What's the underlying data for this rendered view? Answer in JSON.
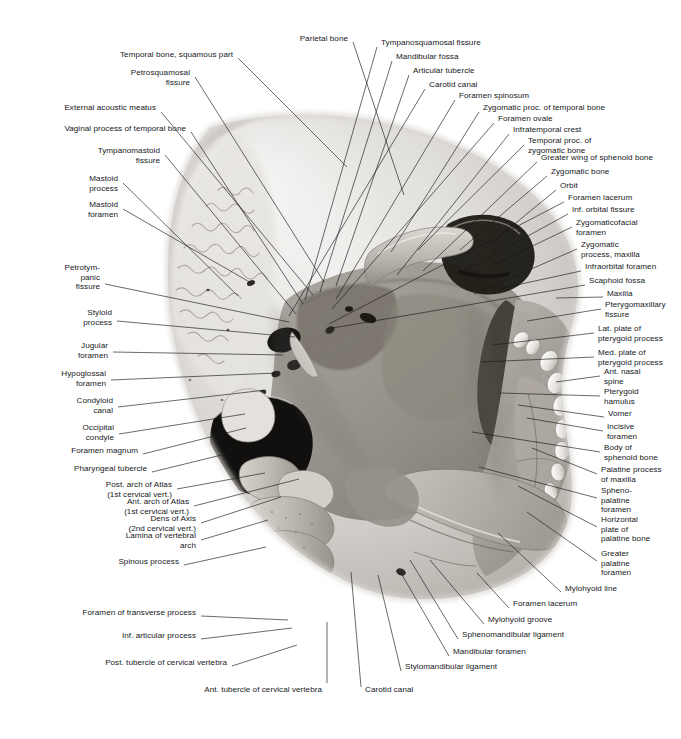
{
  "plate": {
    "kind": "anatomical-illustration",
    "subject": "Inferior view of skull base with cervical vertebrae",
    "render": "grayscale photograph with leader-line callouts",
    "width": 681,
    "height": 739,
    "background": "#ffffff",
    "leader_color": "#1a1a1a",
    "text_color": "#16181a"
  },
  "labels": [
    {
      "id": "temporal-bone-squamous-part",
      "text": "Temporal bone, squamous part",
      "align": "r",
      "x": 233,
      "y": 55,
      "lx": 238,
      "ly": 58,
      "tx": 347,
      "ty": 167
    },
    {
      "id": "parietal-bone",
      "text": "Parietal bone",
      "align": "r",
      "x": 348,
      "y": 39,
      "lx": 353,
      "ly": 42,
      "tx": 404,
      "ty": 195
    },
    {
      "id": "tympanosquamosal-fissure",
      "text": "Tympanosquamosal fissure",
      "align": "l",
      "x": 381,
      "y": 43,
      "lx": 377,
      "ly": 47,
      "tx": 305,
      "ty": 300
    },
    {
      "id": "petrosquamosal-fissure",
      "text": "Petrosquamosal\nfissure",
      "align": "r",
      "x": 190,
      "y": 73,
      "lx": 195,
      "ly": 77,
      "tx": 324,
      "ty": 282
    },
    {
      "id": "mandibular-fossa",
      "text": "Mandibular fossa",
      "align": "l",
      "x": 396,
      "y": 57,
      "lx": 392,
      "ly": 61,
      "tx": 320,
      "ty": 292
    },
    {
      "id": "articular-tubercle",
      "text": "Articular tubercle",
      "align": "l",
      "x": 413,
      "y": 71,
      "lx": 409,
      "ly": 75,
      "tx": 336,
      "ty": 286
    },
    {
      "id": "carotid-canal-top",
      "text": "Carotid canal",
      "align": "l",
      "x": 429,
      "y": 85,
      "lx": 425,
      "ly": 89,
      "tx": 289,
      "ty": 316
    },
    {
      "id": "external-acoustic-meatus",
      "text": "External acoustic meatus",
      "align": "r",
      "x": 156,
      "y": 108,
      "lx": 161,
      "ly": 112,
      "tx": 313,
      "ty": 295
    },
    {
      "id": "foramen-spinosum",
      "text": "Foramen spinosum",
      "align": "l",
      "x": 459,
      "y": 96,
      "lx": 455,
      "ly": 100,
      "tx": 336,
      "ty": 299
    },
    {
      "id": "zygomatic-proc-of-temporal-bone",
      "text": "Zygomatic proc. of temporal bone",
      "align": "l",
      "x": 483,
      "y": 108,
      "lx": 479,
      "ly": 112,
      "tx": 391,
      "ty": 252
    },
    {
      "id": "vaginal-process-of-temporal-bone",
      "text": "Vaginal process of temporal bone",
      "align": "r",
      "x": 186,
      "y": 129,
      "lx": 191,
      "ly": 132,
      "tx": 303,
      "ty": 304
    },
    {
      "id": "foramen-ovale",
      "text": "Foramen ovale",
      "align": "l",
      "x": 498,
      "y": 119,
      "lx": 494,
      "ly": 123,
      "tx": 332,
      "ty": 309
    },
    {
      "id": "infratemporal-crest",
      "text": "Infratemporal crest",
      "align": "l",
      "x": 513,
      "y": 130,
      "lx": 509,
      "ly": 134,
      "tx": 397,
      "ty": 275
    },
    {
      "id": "temporal-proc-of-zygomatic-bone",
      "text": "Temporal proc. of\nzygomatic bone",
      "align": "l",
      "x": 528,
      "y": 141,
      "lx": 524,
      "ly": 145,
      "tx": 418,
      "ty": 250
    },
    {
      "id": "tympanomastoid-fissure",
      "text": "Tympanomastoid\nfissure",
      "align": "r",
      "x": 160,
      "y": 151,
      "lx": 165,
      "ly": 155,
      "tx": 296,
      "ty": 314
    },
    {
      "id": "greater-wing-of-sphenoid-bone",
      "text": "Greater wing of sphenoid bone",
      "align": "l",
      "x": 541,
      "y": 158,
      "lx": 537,
      "ly": 162,
      "tx": 423,
      "ty": 271
    },
    {
      "id": "zygomatic-bone",
      "text": "Zygomatic bone",
      "align": "l",
      "x": 551,
      "y": 172,
      "lx": 547,
      "ly": 176,
      "tx": 460,
      "ty": 250
    },
    {
      "id": "orbit",
      "text": "Orbit",
      "align": "l",
      "x": 560,
      "y": 186,
      "lx": 556,
      "ly": 190,
      "tx": 478,
      "ty": 254
    },
    {
      "id": "mastoid-process",
      "text": "Mastoid\nprocess",
      "align": "r",
      "x": 118,
      "y": 179,
      "lx": 123,
      "ly": 183,
      "tx": 238,
      "ty": 296
    },
    {
      "id": "foramen-lacerum-top",
      "text": "Foramen lacerum",
      "align": "l",
      "x": 568,
      "y": 198,
      "lx": 564,
      "ly": 202,
      "tx": 329,
      "ty": 324
    },
    {
      "id": "inf-orbital-fissure",
      "text": "Inf. orbital fissure",
      "align": "l",
      "x": 572,
      "y": 210,
      "lx": 568,
      "ly": 214,
      "tx": 466,
      "ty": 270
    },
    {
      "id": "zygomaticofacial-foramen",
      "text": "Zygomaticofacial\nforamen",
      "align": "l",
      "x": 576,
      "y": 223,
      "lx": 572,
      "ly": 227,
      "tx": 487,
      "ty": 268
    },
    {
      "id": "mastoid-foramen",
      "text": "Mastoid\nforamen",
      "align": "r",
      "x": 118,
      "y": 205,
      "lx": 123,
      "ly": 209,
      "tx": 253,
      "ty": 284
    },
    {
      "id": "zygomatic-process-maxilla",
      "text": "Zygomatic\nprocess, maxilla",
      "align": "l",
      "x": 581,
      "y": 245,
      "lx": 577,
      "ly": 249,
      "tx": 474,
      "ty": 294
    },
    {
      "id": "infraorbital-foramen",
      "text": "Infraorbital foramen",
      "align": "l",
      "x": 585,
      "y": 267,
      "lx": 581,
      "ly": 271,
      "tx": 498,
      "ty": 289
    },
    {
      "id": "scaphoid-fossa",
      "text": "Scaphoid fossa",
      "align": "l",
      "x": 589,
      "y": 281,
      "lx": 585,
      "ly": 285,
      "tx": 327,
      "ty": 329
    },
    {
      "id": "petrotympanic-fissure",
      "text": "Petrotym-\npanic\nfissure",
      "align": "r",
      "x": 100,
      "y": 268,
      "lx": 105,
      "ly": 284,
      "tx": 289,
      "ty": 322
    },
    {
      "id": "maxilla",
      "text": "Maxilla",
      "align": "l",
      "x": 607,
      "y": 294,
      "lx": 603,
      "ly": 297,
      "tx": 556,
      "ty": 298
    },
    {
      "id": "pterygomaxillary-fissure",
      "text": "Pterygomaxillary\nfissure",
      "align": "l",
      "x": 605,
      "y": 305,
      "lx": 601,
      "ly": 309,
      "tx": 527,
      "ty": 321
    },
    {
      "id": "styloid-process",
      "text": "Styloid\nprocess",
      "align": "r",
      "x": 112,
      "y": 313,
      "lx": 117,
      "ly": 321,
      "tx": 295,
      "ty": 337
    },
    {
      "id": "lat-plate-of-pterygoid-process",
      "text": "Lat. plate of\npterygoid process",
      "align": "l",
      "x": 598,
      "y": 329,
      "lx": 594,
      "ly": 333,
      "tx": 493,
      "ty": 345
    },
    {
      "id": "jugular-foramen",
      "text": "Jugular\nforamen",
      "align": "r",
      "x": 108,
      "y": 346,
      "lx": 113,
      "ly": 352,
      "tx": 283,
      "ty": 355
    },
    {
      "id": "med-plate-of-pterygoid-process",
      "text": "Med. plate of\npterygoid process",
      "align": "l",
      "x": 598,
      "y": 353,
      "lx": 594,
      "ly": 357,
      "tx": 481,
      "ty": 362
    },
    {
      "id": "hypoglossal-foramen",
      "text": "Hypoglossal\nforamen",
      "align": "r",
      "x": 106,
      "y": 374,
      "lx": 111,
      "ly": 380,
      "tx": 277,
      "ty": 373
    },
    {
      "id": "ant-nasal-spine",
      "text": "Ant. nasal\nspine",
      "align": "l",
      "x": 604,
      "y": 372,
      "lx": 600,
      "ly": 376,
      "tx": 556,
      "ty": 382
    },
    {
      "id": "condyloid-canal",
      "text": "Condyloid\ncanal",
      "align": "r",
      "x": 113,
      "y": 401,
      "lx": 118,
      "ly": 407,
      "tx": 266,
      "ty": 390
    },
    {
      "id": "pterygoid-hamulus",
      "text": "Pterygoid\nhamulus",
      "align": "l",
      "x": 604,
      "y": 392,
      "lx": 600,
      "ly": 396,
      "tx": 500,
      "ty": 393
    },
    {
      "id": "vomer",
      "text": "Vomer",
      "align": "l",
      "x": 608,
      "y": 414,
      "lx": 604,
      "ly": 417,
      "tx": 518,
      "ty": 405
    },
    {
      "id": "occipital-condyle",
      "text": "Occipital\ncondyle",
      "align": "r",
      "x": 114,
      "y": 428,
      "lx": 119,
      "ly": 434,
      "tx": 245,
      "ty": 414
    },
    {
      "id": "incisive-foramen",
      "text": "Incisive\nforamen",
      "align": "l",
      "x": 607,
      "y": 427,
      "lx": 603,
      "ly": 431,
      "tx": 527,
      "ty": 418
    },
    {
      "id": "foramen-magnum",
      "text": "Foramen magnum",
      "align": "r",
      "x": 138,
      "y": 451,
      "lx": 143,
      "ly": 454,
      "tx": 246,
      "ty": 428
    },
    {
      "id": "body-of-sphenoid-bone",
      "text": "Body of\nsphenoid bone",
      "align": "l",
      "x": 604,
      "y": 448,
      "lx": 600,
      "ly": 452,
      "tx": 472,
      "ty": 432
    },
    {
      "id": "pharyngeal-tubercle",
      "text": "Pharyngeal tubercle",
      "align": "r",
      "x": 147,
      "y": 469,
      "lx": 152,
      "ly": 472,
      "tx": 279,
      "ty": 441
    },
    {
      "id": "palatine-process-of-maxilla",
      "text": "Palatine process\nof maxilla",
      "align": "l",
      "x": 601,
      "y": 470,
      "lx": 597,
      "ly": 474,
      "tx": 532,
      "ty": 448
    },
    {
      "id": "post-arch-of-atlas",
      "text": "Post. arch of Atlas\n(1st cervical vert.)",
      "align": "r",
      "x": 172,
      "y": 485,
      "lx": 177,
      "ly": 489,
      "tx": 265,
      "ty": 473
    },
    {
      "id": "spheno-palatine-foramen",
      "text": "Spheno-\npalatine\nforamen",
      "align": "l",
      "x": 601,
      "y": 491,
      "lx": 597,
      "ly": 498,
      "tx": 479,
      "ty": 467
    },
    {
      "id": "ant-arch-of-atlas",
      "text": "Ant. arch of Atlas\n(1st cervical vert.)",
      "align": "r",
      "x": 189,
      "y": 502,
      "lx": 194,
      "ly": 506,
      "tx": 299,
      "ty": 479
    },
    {
      "id": "dens-of-axis",
      "text": "Dens of Axis\n(2nd cervical vert.)",
      "align": "r",
      "x": 196,
      "y": 519,
      "lx": 201,
      "ly": 523,
      "tx": 281,
      "ty": 497
    },
    {
      "id": "lamina-of-vertebral-arch",
      "text": "Lamina of vertebral\narch",
      "align": "r",
      "x": 196,
      "y": 536,
      "lx": 201,
      "ly": 540,
      "tx": 268,
      "ty": 520
    },
    {
      "id": "horizontal-plate-of-palatine-bone",
      "text": "Horizontal\nplate of\npalatine bone",
      "align": "l",
      "x": 601,
      "y": 520,
      "lx": 597,
      "ly": 527,
      "tx": 518,
      "ty": 486
    },
    {
      "id": "spinous-process",
      "text": "Spinous process",
      "align": "r",
      "x": 179,
      "y": 562,
      "lx": 184,
      "ly": 565,
      "tx": 266,
      "ty": 547
    },
    {
      "id": "greater-palatine-foramen",
      "text": "Greater\npalatine\nforamen",
      "align": "l",
      "x": 601,
      "y": 554,
      "lx": 597,
      "ly": 561,
      "tx": 527,
      "ty": 512
    },
    {
      "id": "mylohyoid-line",
      "text": "Mylohyoid line",
      "align": "l",
      "x": 565,
      "y": 589,
      "lx": 561,
      "ly": 592,
      "tx": 498,
      "ty": 533
    },
    {
      "id": "foramen-of-transverse-process",
      "text": "Foramen of transverse process",
      "align": "r",
      "x": 196,
      "y": 613,
      "lx": 201,
      "ly": 616,
      "tx": 288,
      "ty": 620
    },
    {
      "id": "foramen-lacerum-bottom",
      "text": "Foramen lacerum",
      "align": "l",
      "x": 513,
      "y": 604,
      "lx": 509,
      "ly": 608,
      "tx": 477,
      "ty": 573
    },
    {
      "id": "mylohyoid-groove",
      "text": "Mylohyoid groove",
      "align": "l",
      "x": 488,
      "y": 620,
      "lx": 484,
      "ly": 624,
      "tx": 430,
      "ty": 560
    },
    {
      "id": "inf-articular-process",
      "text": "Inf. articular process",
      "align": "r",
      "x": 196,
      "y": 636,
      "lx": 201,
      "ly": 639,
      "tx": 292,
      "ty": 628
    },
    {
      "id": "sphenomandibular-ligament",
      "text": "Sphenomandibular ligament",
      "align": "l",
      "x": 462,
      "y": 635,
      "lx": 458,
      "ly": 639,
      "tx": 410,
      "ty": 560
    },
    {
      "id": "mandibular-foramen",
      "text": "Mandibular foramen",
      "align": "l",
      "x": 453,
      "y": 652,
      "lx": 449,
      "ly": 656,
      "tx": 401,
      "ty": 573
    },
    {
      "id": "post-tubercle-of-cervical-vertebra",
      "text": "Post. tubercle of cervical vertebra",
      "align": "r",
      "x": 227,
      "y": 663,
      "lx": 232,
      "ly": 666,
      "tx": 297,
      "ty": 645
    },
    {
      "id": "stylomandibular-ligament",
      "text": "Stylomandibular ligament",
      "align": "l",
      "x": 405,
      "y": 667,
      "lx": 401,
      "ly": 671,
      "tx": 378,
      "ty": 575
    },
    {
      "id": "ant-tubercle-of-cervical-vertebra",
      "text": "Ant. tubercle of cervical vertebra",
      "align": "r",
      "x": 322,
      "y": 690,
      "lx": 327,
      "ly": 683,
      "tx": 327,
      "ty": 622
    },
    {
      "id": "carotid-canal-bottom",
      "text": "Carotid canal",
      "align": "l",
      "x": 365,
      "y": 690,
      "lx": 361,
      "ly": 687,
      "tx": 351,
      "ty": 572
    }
  ]
}
